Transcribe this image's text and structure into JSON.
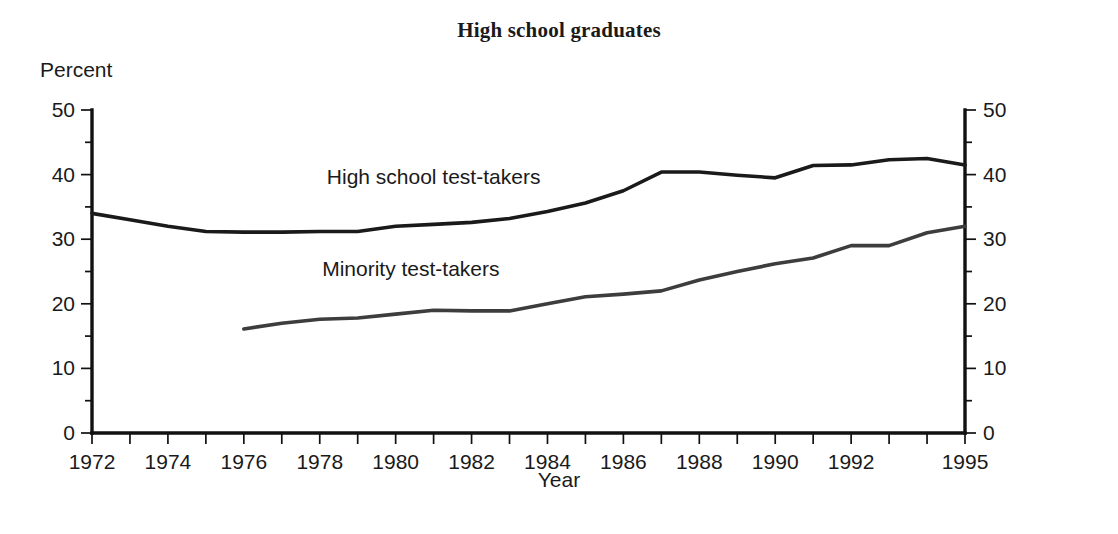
{
  "figure": {
    "title": "High school graduates",
    "y_unit_label": "Percent",
    "x_axis_title": "Year"
  },
  "chart_data": {
    "type": "line",
    "title": "High school graduates",
    "xlabel": "Year",
    "ylabel": "Percent",
    "xlim": [
      1972,
      1995
    ],
    "ylim": [
      0,
      50
    ],
    "grid": false,
    "legend": "inline-annotations",
    "y_ticks": [
      0,
      10,
      20,
      30,
      40,
      50
    ],
    "y_minor_tick_step": 5,
    "y_axis_left_labels": [
      "0",
      "10",
      "20",
      "30",
      "40",
      "50"
    ],
    "y_axis_right_labels": [
      "0",
      "10",
      "20",
      "30",
      "40",
      "50"
    ],
    "x_ticks": [
      1972,
      1973,
      1974,
      1975,
      1976,
      1977,
      1978,
      1979,
      1980,
      1981,
      1982,
      1983,
      1984,
      1985,
      1986,
      1987,
      1988,
      1989,
      1990,
      1991,
      1992,
      1993,
      1994,
      1995
    ],
    "x_tick_labels": [
      "1972",
      "1974",
      "1976",
      "1978",
      "1980",
      "1982",
      "1984",
      "1986",
      "1988",
      "1990",
      "1992",
      "1995"
    ],
    "x_tick_label_years": [
      1972,
      1974,
      1976,
      1978,
      1980,
      1982,
      1984,
      1986,
      1988,
      1990,
      1992,
      1995
    ],
    "series": [
      {
        "name": "High school test-takers",
        "annotation": "High school test-takers",
        "color": "#1a1a1a",
        "x": [
          1972,
          1973,
          1974,
          1975,
          1976,
          1977,
          1978,
          1979,
          1980,
          1981,
          1982,
          1983,
          1984,
          1985,
          1986,
          1987,
          1988,
          1989,
          1990,
          1991,
          1992,
          1993,
          1994,
          1995
        ],
        "values": [
          34.0,
          33.0,
          32.0,
          31.2,
          31.1,
          31.1,
          31.2,
          31.2,
          32.0,
          32.3,
          32.6,
          33.2,
          34.3,
          35.6,
          37.5,
          40.4,
          40.4,
          39.9,
          39.5,
          41.4,
          41.5,
          42.3,
          42.5,
          41.5
        ]
      },
      {
        "name": "Minority test-takers",
        "annotation": "Minority test-takers",
        "color": "#3d3d3d",
        "x": [
          1976,
          1977,
          1978,
          1979,
          1980,
          1981,
          1982,
          1983,
          1984,
          1985,
          1986,
          1987,
          1988,
          1989,
          1990,
          1991,
          1992,
          1993,
          1994,
          1995
        ],
        "values": [
          16.1,
          17.0,
          17.6,
          17.8,
          18.4,
          19.0,
          18.9,
          18.9,
          20.0,
          21.1,
          21.5,
          22.0,
          23.7,
          25.0,
          26.2,
          27.1,
          29.0,
          29.0,
          31.0,
          32.0
        ]
      }
    ],
    "annotations": [
      {
        "text": "High school test-takers",
        "x": 1981.0,
        "y": 38.5
      },
      {
        "text": "Minority test-takers",
        "x": 1980.4,
        "y": 24.3
      }
    ]
  }
}
